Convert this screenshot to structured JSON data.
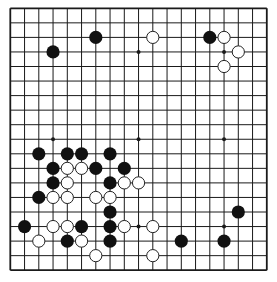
{
  "board": {
    "size": 19,
    "origin_x": 10.3,
    "origin_y": 8.3,
    "step_x": 14.25,
    "step_y": 14.55,
    "stone_radius": 6.6,
    "line_color": "#1a1a1a",
    "background": "#ffffff",
    "star_points": [
      [
        3,
        3
      ],
      [
        9,
        3
      ],
      [
        15,
        3
      ],
      [
        3,
        9
      ],
      [
        9,
        9
      ],
      [
        15,
        9
      ],
      [
        3,
        15
      ],
      [
        9,
        15
      ],
      [
        15,
        15
      ]
    ],
    "black_color": "#111111",
    "white_color": "#ffffff",
    "stones": {
      "black": [
        [
          6,
          2
        ],
        [
          14,
          2
        ],
        [
          3,
          3
        ],
        [
          2,
          10
        ],
        [
          4,
          10
        ],
        [
          5,
          10
        ],
        [
          7,
          10
        ],
        [
          3,
          11
        ],
        [
          6,
          11
        ],
        [
          8,
          11
        ],
        [
          3,
          12
        ],
        [
          7,
          12
        ],
        [
          2,
          13
        ],
        [
          7,
          14
        ],
        [
          16,
          14
        ],
        [
          1,
          15
        ],
        [
          5,
          15
        ],
        [
          7,
          15
        ],
        [
          4,
          16
        ],
        [
          7,
          16
        ],
        [
          12,
          16
        ],
        [
          15,
          16
        ]
      ],
      "white": [
        [
          10,
          2
        ],
        [
          15,
          2
        ],
        [
          16,
          3
        ],
        [
          15,
          4
        ],
        [
          4,
          11
        ],
        [
          5,
          11
        ],
        [
          4,
          12
        ],
        [
          8,
          12
        ],
        [
          9,
          12
        ],
        [
          3,
          13
        ],
        [
          4,
          13
        ],
        [
          6,
          13
        ],
        [
          7,
          13
        ],
        [
          3,
          15
        ],
        [
          4,
          15
        ],
        [
          8,
          15
        ],
        [
          10,
          15
        ],
        [
          2,
          16
        ],
        [
          5,
          16
        ],
        [
          6,
          17
        ],
        [
          10,
          17
        ]
      ]
    }
  }
}
